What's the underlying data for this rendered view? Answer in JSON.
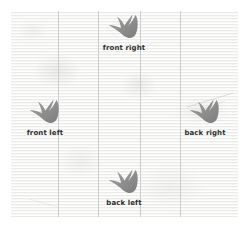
{
  "figure": {
    "type": "annotated-photograph",
    "background_color": "#f7f7f6",
    "gridline_color": "#c6c6c8",
    "footprint_color": "#8e8e8e",
    "label_color": "#2e2e2e"
  },
  "gridlines": {
    "vertical": [
      47,
      87,
      129,
      169
    ]
  },
  "footprints": [
    {
      "id": "front-right",
      "label": "front right",
      "icon": "footprint-icon",
      "x": 113,
      "y": 2
    },
    {
      "id": "front-left",
      "label": "front left",
      "icon": "footprint-icon",
      "x": 34,
      "y": 87
    },
    {
      "id": "back-right",
      "label": "back right",
      "icon": "footprint-icon",
      "x": 194,
      "y": 87
    },
    {
      "id": "back-left",
      "label": "back left",
      "icon": "footprint-icon",
      "x": 113,
      "y": 157
    }
  ]
}
